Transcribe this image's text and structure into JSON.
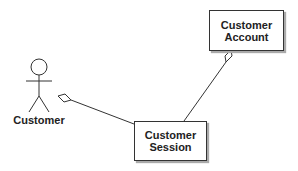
{
  "diagram": {
    "type": "UML class/use-case diagram",
    "actor": {
      "label": "Customer"
    },
    "classes": [
      {
        "id": "account",
        "line1": "Customer",
        "line2": "Account"
      },
      {
        "id": "session",
        "line1": "Customer",
        "line2": "Session"
      }
    ],
    "associations": [
      {
        "from": "session",
        "to": "actor",
        "end": "aggregation-diamond"
      },
      {
        "from": "session",
        "to": "account",
        "end": "aggregation-diamond"
      }
    ]
  }
}
